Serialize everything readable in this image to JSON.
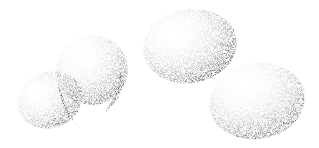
{
  "image": {
    "description": "Stippled black-and-white illustration of eggs: a cracked egg split into two halves on the left, a whole egg in the top center, and a whole egg lower right",
    "background": "#ffffff",
    "ink": "#111111",
    "objects": [
      {
        "name": "cracked-egg-back-half",
        "cx": 52,
        "cy": 100,
        "rx": 34,
        "ry": 26,
        "rotate": -20
      },
      {
        "name": "cracked-egg-front-half",
        "cx": 92,
        "cy": 72,
        "rx": 36,
        "ry": 36,
        "rotate": -15
      },
      {
        "name": "whole-egg-center",
        "cx": 190,
        "cy": 45,
        "rx": 48,
        "ry": 38,
        "rotate": -10
      },
      {
        "name": "whole-egg-right",
        "cx": 257,
        "cy": 100,
        "rx": 48,
        "ry": 38,
        "rotate": -10
      }
    ]
  }
}
